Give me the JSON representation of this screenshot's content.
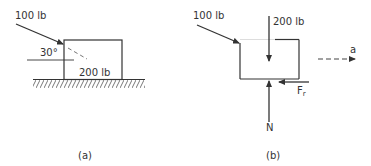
{
  "figure_a": {
    "caption": "(a)",
    "applied_force_label": "100 lb",
    "angle_label": "30°",
    "weight_label": "200 lb"
  },
  "figure_b": {
    "caption": "(b)",
    "applied_force_label": "100 lb",
    "weight_label": "200 lb",
    "friction_label": "F",
    "friction_subscript": "r",
    "normal_label": "N",
    "acceleration_label": "a"
  },
  "colors": {
    "ink": "#333333",
    "dashed": "#666666",
    "background": "#ffffff"
  }
}
